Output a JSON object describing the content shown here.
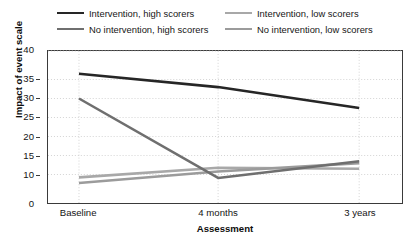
{
  "chart_data": {
    "type": "line",
    "title": "",
    "xlabel": "Assessment",
    "ylabel": "Impact of event scale",
    "x": [
      "Baseline",
      "4 months",
      "3 years"
    ],
    "categories": [
      "Baseline",
      "4 months",
      "3 years"
    ],
    "ylim": [
      0,
      40
    ],
    "y_ticks": [
      0,
      10,
      15,
      20,
      25,
      30,
      35,
      40
    ],
    "y_tick_labels": [
      "0",
      "10",
      "15",
      "20",
      "25",
      "30",
      "35",
      "40"
    ],
    "grid": true,
    "grid_style": "dotted",
    "legend_position": "top",
    "series": [
      {
        "name": "Intervention, high scorers",
        "color": "#262626",
        "width": 2.6,
        "values": [
          36,
          33,
          27.5
        ]
      },
      {
        "name": "No intervention, high scorers",
        "color": "#6f6f6f",
        "width": 2.6,
        "values": [
          30,
          8.8,
          13.5
        ]
      },
      {
        "name": "Intervention, low scorers",
        "color": "#a8a8a8",
        "width": 2.6,
        "values": [
          9,
          11.8,
          11.5
        ]
      },
      {
        "name": "No intervention, low scorers",
        "color": "#9b9b9b",
        "width": 2.6,
        "values": [
          7,
          10.8,
          13
        ]
      }
    ]
  },
  "legend": {
    "entries": [
      {
        "label": "Intervention, high scorers",
        "color": "#262626"
      },
      {
        "label": "Intervention, low scorers",
        "color": "#a8a8a8"
      },
      {
        "label": "No intervention, high scorers",
        "color": "#6f6f6f"
      },
      {
        "label": "No intervention, low scorers",
        "color": "#9b9b9b"
      }
    ]
  },
  "colors": {
    "axis": "#3a3a3a",
    "grid": "#c9c9c9",
    "text": "#141414",
    "background": "#ffffff"
  }
}
